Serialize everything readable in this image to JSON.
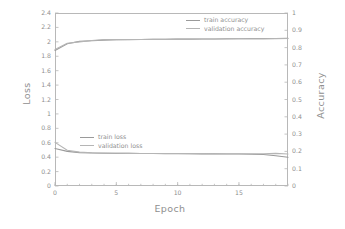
{
  "chart_data": {
    "type": "line",
    "title": "",
    "subtitle": "",
    "xlabel": "Epoch",
    "ylabel": "Loss",
    "y2label": "Accuracy",
    "xlim": [
      0,
      19
    ],
    "ylim": [
      0,
      2.4
    ],
    "y2lim": [
      0,
      1
    ],
    "grid": false,
    "legend_position": "inside-upper-right (accuracy), inside-middle-left (loss)",
    "x": [
      0,
      1,
      2,
      3,
      4,
      5,
      6,
      7,
      8,
      9,
      10,
      11,
      12,
      13,
      14,
      15,
      16,
      17,
      18,
      19
    ],
    "xticks": [
      0,
      5,
      10,
      15
    ],
    "xticklabels": [
      "0",
      "5",
      "10",
      "15"
    ],
    "xminorticks": [
      0,
      1,
      2,
      3,
      4,
      5,
      6,
      7,
      8,
      9,
      10,
      11,
      12,
      13,
      14,
      15,
      16,
      17,
      18,
      19
    ],
    "yticks": [
      0,
      0.2,
      0.4,
      0.6,
      0.8,
      1,
      1.2,
      1.4,
      1.6,
      1.8,
      2,
      2.2,
      2.4
    ],
    "yticklabels": [
      "0",
      "0.2",
      "0.4",
      "0.6",
      "0.8",
      "1",
      "1.2",
      "1.4",
      "1.6",
      "1.8",
      "2",
      "2.2",
      "2.4"
    ],
    "y2ticks": [
      0,
      0.1,
      0.2,
      0.3,
      0.4,
      0.5,
      0.6,
      0.7,
      0.8,
      0.9,
      1
    ],
    "y2ticklabels": [
      "0",
      "0.1",
      "0.2",
      "0.3",
      "0.4",
      "0.5",
      "0.6",
      "0.7",
      "0.8",
      "0.9",
      "1"
    ],
    "series": [
      {
        "name": "train accuracy",
        "axis": "right",
        "color": "#9a9a9a",
        "values": [
          0.783,
          0.822,
          0.836,
          0.84,
          0.843,
          0.845,
          0.846,
          0.847,
          0.848,
          0.848,
          0.849,
          0.849,
          0.85,
          0.85,
          0.851,
          0.851,
          0.852,
          0.852,
          0.853,
          0.854
        ]
      },
      {
        "name": "validation accuracy",
        "axis": "right",
        "color": "#b5b5b5",
        "values": [
          0.789,
          0.825,
          0.833,
          0.841,
          0.846,
          0.846,
          0.847,
          0.847,
          0.848,
          0.848,
          0.849,
          0.849,
          0.85,
          0.85,
          0.85,
          0.851,
          0.851,
          0.851,
          0.852,
          0.853
        ]
      },
      {
        "name": "train loss",
        "axis": "left",
        "color": "#9a9a9a",
        "values": [
          0.52,
          0.48,
          0.463,
          0.458,
          0.455,
          0.453,
          0.452,
          0.451,
          0.45,
          0.449,
          0.448,
          0.447,
          0.446,
          0.445,
          0.444,
          0.443,
          0.441,
          0.438,
          0.42,
          0.398
        ]
      },
      {
        "name": "validation loss",
        "axis": "left",
        "color": "#b5b5b5",
        "values": [
          0.605,
          0.497,
          0.47,
          0.461,
          0.456,
          0.454,
          0.452,
          0.451,
          0.451,
          0.45,
          0.45,
          0.449,
          0.449,
          0.448,
          0.448,
          0.447,
          0.447,
          0.448,
          0.452,
          0.443
        ]
      }
    ]
  },
  "axes": {
    "left_title": "Loss",
    "right_title": "Accuracy",
    "bottom_title": "Epoch"
  },
  "legend_accuracy": {
    "items": [
      {
        "label": "train accuracy",
        "color": "#9a9a9a"
      },
      {
        "label": "validation accuracy",
        "color": "#b5b5b5"
      }
    ]
  },
  "legend_loss": {
    "items": [
      {
        "label": "train loss",
        "color": "#9a9a9a"
      },
      {
        "label": "validation loss",
        "color": "#b5b5b5"
      }
    ]
  },
  "colors": {
    "frame": "#b8b8b8",
    "text": "#8f8f8f",
    "background": "#ffffff",
    "train": "#9a9a9a",
    "validation": "#b5b5b5"
  }
}
